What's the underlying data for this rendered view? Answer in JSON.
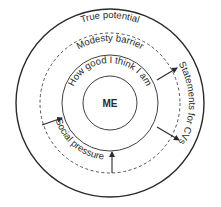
{
  "diagram": {
    "center_label": "ME",
    "rings": [
      {
        "id": "inner",
        "label": "How good I think I am",
        "style": "solid"
      },
      {
        "id": "dashed",
        "label": "Modesty barrier",
        "style": "dashed"
      },
      {
        "id": "outer",
        "label": "True potential",
        "style": "solid"
      }
    ],
    "labels": {
      "true_potential": "True potential",
      "modesty_barrier": "Modesty barrier",
      "how_good": "How good I think I am",
      "statements": "Statements for CVs",
      "social_pressure": "Social pressure",
      "me": "ME"
    },
    "arrows": [
      {
        "name": "social-pressure-arrow-left",
        "direction": "inward"
      },
      {
        "name": "social-pressure-arrow-bottom",
        "direction": "inward"
      },
      {
        "name": "statements-arrow-upper",
        "direction": "outward"
      },
      {
        "name": "statements-arrow-lower",
        "direction": "outward"
      }
    ],
    "colors": {
      "stroke": "#2a2a2a",
      "background": "#ffffff"
    }
  }
}
